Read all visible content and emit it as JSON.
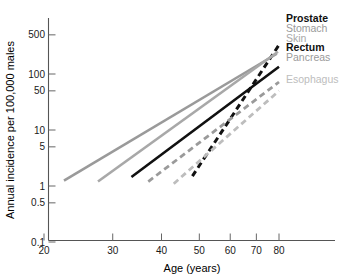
{
  "chart_data": {
    "type": "line",
    "title": "",
    "xlabel": "Age (years)",
    "ylabel": "Annual incidence per 100,000 males",
    "xscale": "log",
    "yscale": "log",
    "xlim": [
      20,
      90
    ],
    "ylim": [
      0.1,
      700
    ],
    "xticks": [
      20,
      30,
      40,
      50,
      60,
      70,
      80
    ],
    "xtick_labels": [
      "20",
      "30",
      "40",
      "50",
      "60",
      "70",
      "80"
    ],
    "yticks": [
      0.1,
      0.5,
      1,
      5,
      10,
      50,
      100,
      500
    ],
    "ytick_labels": [
      "0.1",
      "0.5",
      "1",
      "5",
      "10",
      "50",
      "100",
      "500"
    ],
    "grid": false,
    "legend_position": "right",
    "series": [
      {
        "name": "Prostate",
        "color": "#111111",
        "style": "dashed",
        "width": 3.0,
        "label_bold": true,
        "x": [
          48,
          80
        ],
        "y": [
          1.5,
          330
        ]
      },
      {
        "name": "Stomach",
        "color": "#9a9a9a",
        "style": "solid",
        "width": 2.6,
        "label_bold": false,
        "x": [
          22.5,
          79
        ],
        "y": [
          1.25,
          230
        ]
      },
      {
        "name": "Skin",
        "color": "#a8a8a8",
        "style": "solid",
        "width": 2.6,
        "label_bold": false,
        "x": [
          27.5,
          79.5
        ],
        "y": [
          1.2,
          250
        ]
      },
      {
        "name": "Rectum",
        "color": "#111111",
        "style": "solid",
        "width": 2.6,
        "label_bold": true,
        "x": [
          33.5,
          80
        ],
        "y": [
          1.45,
          135
        ]
      },
      {
        "name": "Pancreas",
        "color": "#9a9a9a",
        "style": "dashed",
        "width": 2.8,
        "label_bold": false,
        "x": [
          37,
          80
        ],
        "y": [
          1.2,
          72
        ]
      },
      {
        "name": "Esophagus",
        "color": "#bdbdbd",
        "style": "dashed",
        "width": 2.8,
        "label_bold": false,
        "x": [
          43,
          80
        ],
        "y": [
          1.1,
          50
        ]
      }
    ],
    "legend_entries": [
      {
        "label": "Prostate",
        "color": "#111111",
        "bold": true
      },
      {
        "label": "Stomach",
        "color": "#9a9a9a",
        "bold": false
      },
      {
        "label": "Skin",
        "color": "#a8a8a8",
        "bold": false
      },
      {
        "label": "Rectum",
        "color": "#111111",
        "bold": true
      },
      {
        "label": "Pancreas",
        "color": "#9a9a9a",
        "bold": false
      },
      {
        "label": "Esophagus",
        "color": "#bdbdbd",
        "bold": false
      }
    ]
  },
  "colors": {
    "background": "#ffffff",
    "axis": "#555555",
    "text": "#1a1a1a"
  }
}
